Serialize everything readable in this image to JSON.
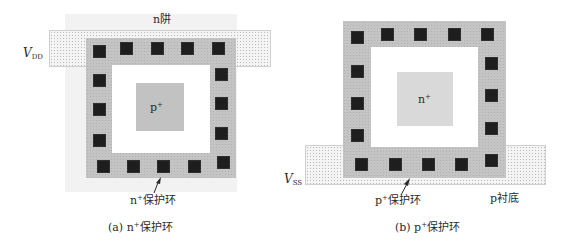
{
  "diagrams": [
    {
      "id": "a",
      "caption": "(a) n⁺保护环",
      "caption_prefix": "(a) n",
      "caption_sup": "+",
      "caption_suffix": "保护环",
      "well_label": "n阱",
      "rail_label_main": "V",
      "rail_label_sub": "DD",
      "center_label_main": "p",
      "center_label_sup": "+",
      "ring_label_main": "n",
      "ring_label_sup": "+",
      "ring_label_suffix": "保护环",
      "contact_count": 16
    },
    {
      "id": "b",
      "caption": "(b) p⁺保护环",
      "caption_prefix": "(b) p",
      "caption_sup": "+",
      "caption_suffix": "保护环",
      "substrate_label": "p衬底",
      "rail_label_main": "V",
      "rail_label_sub": "SS",
      "center_label_main": "n",
      "center_label_sup": "+",
      "ring_label_main": "p",
      "ring_label_sup": "+",
      "ring_label_suffix": "保护环",
      "contact_count": 17
    }
  ],
  "colors": {
    "contact": "#1e1e1e",
    "ring": "#c4c4c4",
    "p_plus_diffusion": "#c2c2c2",
    "n_plus_diffusion": "#d9d9d9",
    "n_well": "#f2f2f2",
    "metal_rail_dotted": "#f4f4f4"
  }
}
